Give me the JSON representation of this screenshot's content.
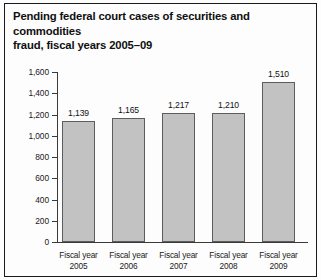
{
  "figure": {
    "title": "Pending federal court cases of securities and commodities\nfraud, fiscal years 2005–09",
    "background_color": "#fdfdfd",
    "border_color": "#1a1a1a",
    "bar_fill_color": "#c2c2c2",
    "bar_edge_color": "#5d5d5d",
    "axis_color": "#3a3a3a"
  },
  "chart_data": {
    "type": "bar",
    "title": "Pending federal court cases of securities and commodities fraud, fiscal years 2005–09",
    "xlabel": "",
    "ylabel": "",
    "categories": [
      "Fiscal year 2005",
      "Fiscal year 2006",
      "Fiscal year 2007",
      "Fiscal year 2008",
      "Fiscal year 2009"
    ],
    "category_lines": [
      [
        "Fiscal year",
        "2005"
      ],
      [
        "Fiscal year",
        "2006"
      ],
      [
        "Fiscal year",
        "2007"
      ],
      [
        "Fiscal year",
        "2008"
      ],
      [
        "Fiscal year",
        "2009"
      ]
    ],
    "values": [
      1139,
      1165,
      1217,
      1210,
      1510
    ],
    "value_labels": [
      "1,139",
      "1,165",
      "1,217",
      "1,210",
      "1,510"
    ],
    "ylim": [
      0,
      1600
    ],
    "ytick_values": [
      1600,
      1400,
      1200,
      1000,
      800,
      600,
      400,
      200,
      0
    ],
    "ytick_labels": [
      "1,600",
      "1,400",
      "1,200",
      "1,000",
      "800",
      "600",
      "400",
      "200",
      "0"
    ],
    "grid": false,
    "legend": null
  }
}
